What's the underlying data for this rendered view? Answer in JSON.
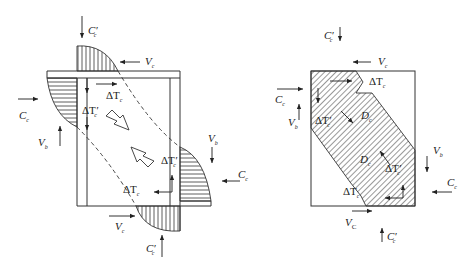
{
  "figure": {
    "left_diagram": {
      "title": "Beam-column joint force transfer (strut & truss)",
      "labels": {
        "top_compression": {
          "main": "C",
          "sub": "c",
          "prime": "′"
        },
        "top_shear": {
          "main": "V",
          "sub": "c"
        },
        "left_compression": {
          "main": "C",
          "sub": "c"
        },
        "left_shear": {
          "main": "V",
          "sub": "b"
        },
        "top_tension": {
          "main": "ΔT",
          "sub": "c"
        },
        "left_tension": {
          "main": "ΔT",
          "sub": "c",
          "prime": "′"
        },
        "right_shear": {
          "main": "V",
          "sub": "b"
        },
        "right_tension": {
          "main": "ΔT",
          "sub": "c",
          "prime": "′"
        },
        "right_compression": {
          "main": "C",
          "sub": "c"
        },
        "bottom_tension": {
          "main": "ΔT",
          "sub": "c"
        },
        "bottom_shear": {
          "main": "V",
          "sub": "c"
        },
        "bottom_compression": {
          "main": "C",
          "sub": "c",
          "prime": "′"
        }
      }
    },
    "right_diagram": {
      "title": "Joint with diagonal compression field",
      "labels": {
        "top_compression": {
          "main": "C",
          "sub": "c",
          "prime": "′"
        },
        "top_shear": {
          "main": "V",
          "sub": "c"
        },
        "top_tension": {
          "main": "ΔT",
          "sub": "c"
        },
        "left_compression": {
          "main": "C",
          "sub": "c"
        },
        "left_shear": {
          "main": "V",
          "sub": "b"
        },
        "left_tension": {
          "main": "ΔT",
          "sub": "c",
          "prime": "′"
        },
        "diag_upper": {
          "main": "D",
          "sub": "c"
        },
        "diag_lower": {
          "main": "D",
          "sub": "c"
        },
        "right_tension": {
          "main": "ΔT",
          "sub": "c",
          "prime": "′"
        },
        "right_shear": {
          "main": "V",
          "sub": "b"
        },
        "right_compression": {
          "main": "C",
          "sub": "c"
        },
        "bottom_tension": {
          "main": "ΔT",
          "sub": "c"
        },
        "bottom_shear": {
          "main": "V",
          "sub": "C"
        },
        "bottom_compression": {
          "main": "C",
          "sub": "c",
          "prime": "′"
        }
      }
    },
    "colors": {
      "line": "#333333",
      "background": "#ffffff",
      "text": "#222222"
    }
  }
}
